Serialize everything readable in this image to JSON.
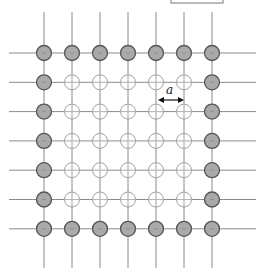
{
  "diagram": {
    "grid": {
      "rows": 7,
      "cols": 7,
      "x0": 44,
      "dx": 28,
      "y0": 53,
      "dy": 29.3,
      "line_left": 9,
      "line_right": 256,
      "line_top": 12,
      "line_bottom": 268
    },
    "site_types": {
      "boundary": {
        "fill": "#a9a9a9",
        "stroke": "#555555",
        "description": "filled boundary site"
      },
      "interior": {
        "fill": "none",
        "stroke": "#a0a0a0",
        "description": "hollow interior site"
      }
    },
    "spacing_label": {
      "text": "a",
      "meaning": "lattice spacing",
      "arrow_x1": 158,
      "arrow_x2": 184,
      "arrow_y": 100,
      "text_x": 166,
      "text_y": 94
    },
    "top_box": {
      "x": 171,
      "y": -10,
      "w": 52,
      "h": 13
    },
    "colors": {
      "line": "#8a8a8a",
      "boundary_fill": "#a9a9a9",
      "boundary_stroke": "#555555",
      "interior_stroke": "#a0a0a0"
    }
  }
}
